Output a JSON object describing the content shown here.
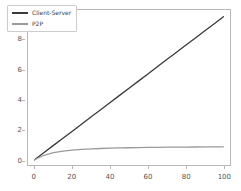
{
  "chart_data": {
    "type": "line",
    "title": "",
    "xlabel": "",
    "ylabel": "",
    "xlim": [
      -3.5,
      103.5
    ],
    "ylim": [
      -0.35,
      10.0
    ],
    "xticks": [
      0,
      20,
      40,
      60,
      80,
      100
    ],
    "yticks": [
      0,
      2,
      4,
      6,
      8,
      10
    ],
    "xtick_labels": [
      "0",
      "20",
      "40",
      "60",
      "80",
      "100"
    ],
    "ytick_labels": [
      "0",
      "2",
      "4",
      "6",
      "8",
      "10"
    ],
    "grid": false,
    "legend_position": "upper left",
    "background_color": "#ffffff",
    "axes_edge_color": "#b8b8b8",
    "tick_label_color": "#545454",
    "x": [
      0,
      5,
      10,
      15,
      20,
      25,
      30,
      35,
      40,
      45,
      50,
      55,
      60,
      65,
      70,
      75,
      80,
      85,
      90,
      95,
      100
    ],
    "series": [
      {
        "name": "Client-Server",
        "color": "#3a3a3a",
        "linewidth": 1.3,
        "values": [
          0.0,
          0.48,
          0.96,
          1.43,
          1.91,
          2.39,
          2.87,
          3.34,
          3.82,
          4.3,
          4.78,
          5.25,
          5.73,
          6.21,
          6.69,
          7.16,
          7.64,
          8.12,
          8.6,
          9.07,
          9.55
        ]
      },
      {
        "name": "P2P",
        "color": "#9a9a9a",
        "linewidth": 1.3,
        "values": [
          0.0,
          0.3,
          0.47,
          0.57,
          0.64,
          0.69,
          0.725,
          0.752,
          0.773,
          0.79,
          0.803,
          0.814,
          0.823,
          0.831,
          0.838,
          0.843,
          0.848,
          0.852,
          0.856,
          0.859,
          0.862
        ]
      }
    ]
  },
  "legend": {
    "entries": [
      {
        "label": "Client-Server"
      },
      {
        "label": "P2P"
      }
    ]
  }
}
